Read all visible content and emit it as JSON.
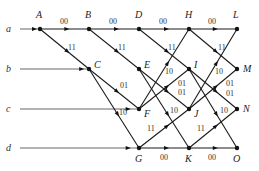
{
  "diagram": {
    "type": "butterfly-network",
    "inputs": [
      {
        "label": "a",
        "y": 29,
        "target": "A"
      },
      {
        "label": "b",
        "y": 69,
        "target": "C"
      },
      {
        "label": "c",
        "y": 109,
        "target": "F"
      },
      {
        "label": "d",
        "y": 148,
        "target": "G"
      }
    ],
    "nodes": [
      {
        "id": "A",
        "x": 40,
        "y": 29,
        "lx": 36,
        "ly": 18
      },
      {
        "id": "B",
        "x": 89,
        "y": 29,
        "lx": 85,
        "ly": 18
      },
      {
        "id": "C",
        "x": 89,
        "y": 69,
        "lx": 94,
        "ly": 68
      },
      {
        "id": "D",
        "x": 139,
        "y": 29,
        "lx": 135,
        "ly": 18
      },
      {
        "id": "E",
        "x": 139,
        "y": 69,
        "lx": 144,
        "ly": 68
      },
      {
        "id": "F",
        "x": 139,
        "y": 109,
        "lx": 144,
        "ly": 117
      },
      {
        "id": "G",
        "x": 139,
        "y": 148,
        "lx": 135,
        "ly": 162
      },
      {
        "id": "H",
        "x": 189,
        "y": 29,
        "lx": 185,
        "ly": 18
      },
      {
        "id": "I",
        "x": 189,
        "y": 69,
        "lx": 194,
        "ly": 68
      },
      {
        "id": "J",
        "x": 189,
        "y": 109,
        "lx": 194,
        "ly": 117
      },
      {
        "id": "K",
        "x": 189,
        "y": 148,
        "lx": 185,
        "ly": 162
      },
      {
        "id": "L",
        "x": 237,
        "y": 29,
        "lx": 233,
        "ly": 18
      },
      {
        "id": "M",
        "x": 237,
        "y": 69,
        "lx": 243,
        "ly": 72
      },
      {
        "id": "N",
        "x": 237,
        "y": 109,
        "lx": 243,
        "ly": 112
      },
      {
        "id": "O",
        "x": 237,
        "y": 148,
        "lx": 233,
        "ly": 162
      }
    ],
    "edges": [
      {
        "from": "A",
        "to": "B",
        "label": "00",
        "lx": 60,
        "ly": 24
      },
      {
        "from": "A",
        "to": "C",
        "label": "11",
        "lx": 68,
        "ly": 50
      },
      {
        "from": "B",
        "to": "D",
        "label": "00",
        "lx": 109,
        "ly": 24
      },
      {
        "from": "B",
        "to": "E",
        "label": "11",
        "lx": 118,
        "ly": 50
      },
      {
        "from": "C",
        "to": "F",
        "label": "01",
        "lx": 120,
        "ly": 88
      },
      {
        "from": "C",
        "to": "G",
        "label": "10",
        "lx": 119,
        "ly": 115
      },
      {
        "from": "D",
        "to": "H",
        "label": "00",
        "lx": 159,
        "ly": 24
      },
      {
        "from": "D",
        "to": "I",
        "label": "11",
        "lx": 168,
        "ly": 50
      },
      {
        "from": "E",
        "to": "J",
        "label": "01",
        "lx": 178,
        "ly": 95
      },
      {
        "from": "E",
        "to": "K",
        "label": "10",
        "lx": 170,
        "ly": 113
      },
      {
        "from": "F",
        "to": "H",
        "label": "10",
        "lx": 165,
        "ly": 74
      },
      {
        "from": "F",
        "to": "I",
        "label": "01",
        "lx": 178,
        "ly": 86
      },
      {
        "from": "G",
        "to": "J",
        "label": "11",
        "lx": 147,
        "ly": 131
      },
      {
        "from": "G",
        "to": "K",
        "label": "00",
        "lx": 160,
        "ly": 160
      },
      {
        "from": "H",
        "to": "L",
        "label": "00",
        "lx": 208,
        "ly": 24
      },
      {
        "from": "H",
        "to": "M",
        "label": "11",
        "lx": 218,
        "ly": 50
      },
      {
        "from": "I",
        "to": "N",
        "label": "01",
        "lx": 226,
        "ly": 96
      },
      {
        "from": "I",
        "to": "O",
        "label": "10",
        "lx": 220,
        "ly": 113
      },
      {
        "from": "J",
        "to": "L",
        "label": "10",
        "lx": 215,
        "ly": 74
      },
      {
        "from": "J",
        "to": "M",
        "label": "01",
        "lx": 226,
        "ly": 86
      },
      {
        "from": "K",
        "to": "N",
        "label": "11",
        "lx": 197,
        "ly": 131
      },
      {
        "from": "K",
        "to": "O",
        "label": "00",
        "lx": 208,
        "ly": 160
      }
    ]
  }
}
